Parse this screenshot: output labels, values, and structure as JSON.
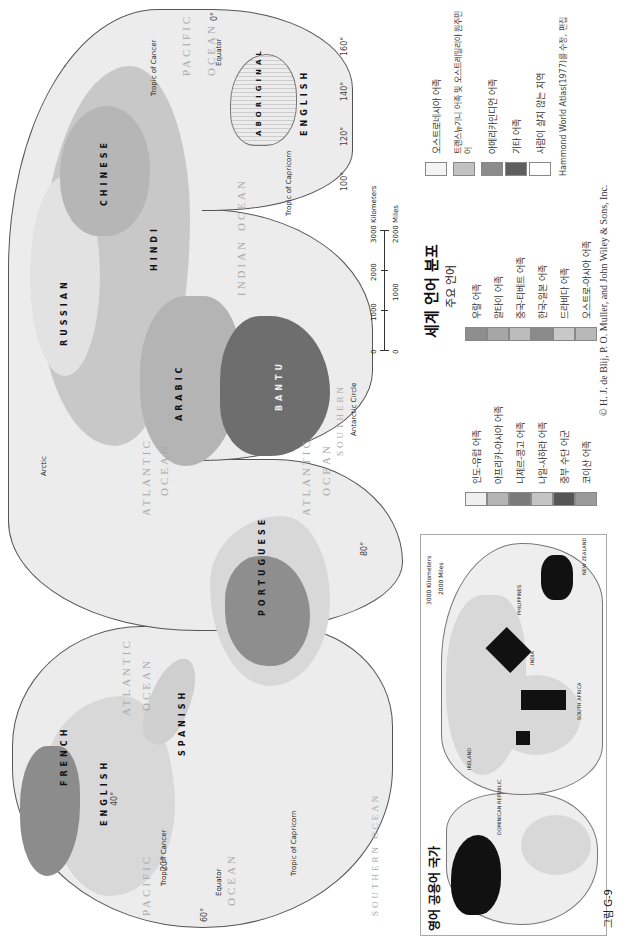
{
  "figure": {
    "number_label": "그림 G-9",
    "main_title": "세계 언어 분포",
    "subtitle": "주요 언어",
    "source_note": "Hammond World Atlas(1977)를 수정, 편집",
    "copyright": "© H. J. de Blij, P. O. Muller, and John Wiley & Sons, Inc."
  },
  "inset_map": {
    "title": "영어 공용어 국가",
    "scale": {
      "km_label": "3000 Kilometers",
      "mi_label": "2000 Miles",
      "zero": "0"
    },
    "labels": [
      "DOMINICAN REPUBLIC",
      "BAHAMAS",
      "JAMAICA",
      "BELIZE",
      "PANAMA",
      "IRELAND",
      "NIGERIA",
      "GHANA",
      "LIBERIA",
      "SIERRA LEONE",
      "GAMBIA",
      "CAMEROON",
      "KENYA",
      "UGANDA",
      "SOMALIA",
      "SOUTH AFRICA",
      "SWAZILAND",
      "LESOTHO",
      "INDIA",
      "SRI LANKA",
      "PHILIPPINES",
      "SINGAPORE",
      "NEW ZEALAND"
    ],
    "colors": {
      "english_official": "#111111",
      "land": "#d8d8d8",
      "ocean": "#f2f2f2"
    }
  },
  "main_map": {
    "scale": {
      "km_ticks": [
        "0",
        "1000",
        "2000",
        "3000 Kilometers"
      ],
      "mi_ticks": [
        "0",
        "1000",
        "2000 Miles"
      ]
    },
    "oceans": [
      "PACIFIC",
      "OCEAN",
      "ATLANTIC",
      "OCEAN",
      "ATLANTIC",
      "OCEAN",
      "INDIAN",
      "OCEAN",
      "PACIFIC",
      "OCEAN",
      "SOUTHERN OCEAN",
      "SOUTHERN",
      "ATLANTIC",
      "OCEAN"
    ],
    "lines": [
      "Tropic of Cancer",
      "Tropic of Capricorn",
      "Equator",
      "Arctic",
      "Antarctic Circle",
      "Tropic of Cancer",
      "Tropic of Capricorn",
      "Equator"
    ],
    "languages": [
      "ENGLISH",
      "SPANISH",
      "PORTUGUESE",
      "FRENCH",
      "RUSSIAN",
      "ARABIC",
      "CHINESE",
      "HINDI",
      "BANTU",
      "ENGLISH",
      "ABORIGINAL",
      "MALAGASY",
      "KAZAKH",
      "PERSIAN",
      "TIBETAN",
      "JAPANESE",
      "KOREAN",
      "FILIPINO",
      "MALAY",
      "INDONESIAN",
      "MANDE",
      "BERBER",
      "TUAREG",
      "SWAHILI",
      "HAUSA"
    ],
    "degree_labels": [
      "20°",
      "40°",
      "60°",
      "80°",
      "100°",
      "120°",
      "140°",
      "160°",
      "0°"
    ]
  },
  "legend": {
    "columns": [
      {
        "items": [
          {
            "label": "인도-유럽 어족",
            "color": "#efefef"
          },
          {
            "label": "아프리카-아시아 어족",
            "color": "#b4b4b4"
          },
          {
            "label": "니제르-콩고 어족",
            "color": "#7a7a7a"
          },
          {
            "label": "나일-사하라 어족",
            "color": "#c4c4c4"
          },
          {
            "label": "중부 수단 어군",
            "color": "#555555"
          },
          {
            "label": "코이산 어족",
            "color": "#9a9a9a"
          }
        ]
      },
      {
        "items": [
          {
            "label": "우랄 어족",
            "color": "#8e8e8e"
          },
          {
            "label": "알타이 어족",
            "color": "#a6a6a6"
          },
          {
            "label": "중국-티베트 어족",
            "color": "#bcbcbc"
          },
          {
            "label": "한국-일본 어족",
            "color": "#8a8a8a"
          },
          {
            "label": "드라비다 어족",
            "color": "#c8c8c8"
          },
          {
            "label": "오스트로-아시아 어족",
            "color": "#b8b8b8"
          }
        ]
      },
      {
        "items": [
          {
            "label": "오스트로네시아 어족",
            "color": "#f4f4f4"
          },
          {
            "label": "트랜스뉴기니 어족 및 오스트레일리아 원주민어",
            "color": "#c2c2c2"
          },
          {
            "label": "아메리카인디언 어족",
            "color": "#8c8c8c"
          },
          {
            "label": "기타 어족",
            "color": "#5e5e5e"
          },
          {
            "label": "사람이 살지 않는 지역",
            "color": "#ffffff"
          }
        ]
      }
    ]
  }
}
